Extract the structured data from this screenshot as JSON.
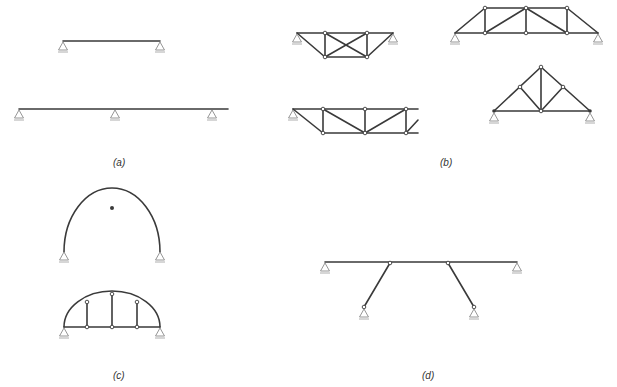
{
  "figure": {
    "panels": [
      {
        "id": "a",
        "label": "(a)",
        "description": "Beams: simply supported single-span beam and two-span continuous beam"
      },
      {
        "id": "b",
        "label": "(b)",
        "description": "Trusses: four truss configurations"
      },
      {
        "id": "c",
        "label": "(c)",
        "description": "Arches: three-hinged arch and tied arch with hangers"
      },
      {
        "id": "d",
        "label": "(d)",
        "description": "Beam supported by two inclined struts (strut-braced beam)"
      }
    ]
  }
}
